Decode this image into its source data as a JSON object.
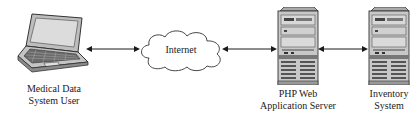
{
  "diagram": {
    "nodes": [
      {
        "id": "user",
        "type": "laptop",
        "label_line1": "Medical Data",
        "label_line2": "System User"
      },
      {
        "id": "internet",
        "type": "cloud",
        "label": "Internet"
      },
      {
        "id": "php_server",
        "type": "server-tower",
        "label_line1": "PHP Web",
        "label_line2": "Application Server"
      },
      {
        "id": "inventory",
        "type": "server-tower",
        "label_line1": "Inventory",
        "label_line2": "System"
      }
    ],
    "edges": [
      {
        "from": "user",
        "to": "internet",
        "style": "bidirectional-arrow"
      },
      {
        "from": "internet",
        "to": "php_server",
        "style": "bidirectional-arrow"
      },
      {
        "from": "php_server",
        "to": "inventory",
        "style": "bidirectional-arrow"
      }
    ],
    "colors": {
      "line": "#1a1a1a",
      "device_fill": "#c8c8c8",
      "device_dark": "#555555",
      "background": "#ffffff"
    }
  }
}
